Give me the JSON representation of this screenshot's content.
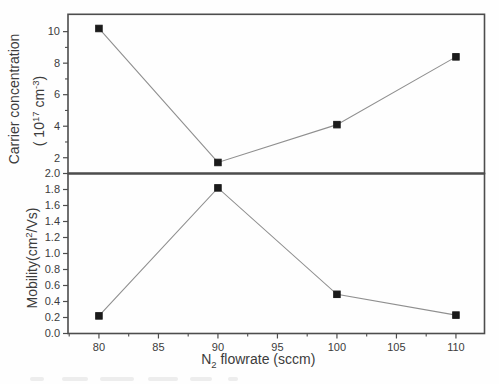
{
  "figure": {
    "colors": {
      "background": "#fefefe",
      "frame": "#4d4d4d",
      "series_line": "#8f8f8f",
      "marker": "#1b1b1b",
      "text": "#3c3c3c"
    }
  },
  "chart_data": [
    {
      "type": "line",
      "panel": "top",
      "series_name": "Carrier concentration",
      "ylabel_line1": "Carrier concentration",
      "ylabel_line2_parts": [
        {
          "t": "( 10"
        },
        {
          "t": "17",
          "script": "sup"
        },
        {
          "t": " cm"
        },
        {
          "t": "-3",
          "script": "sup"
        },
        {
          "t": ")"
        }
      ],
      "x": [
        80,
        90,
        100,
        110
      ],
      "values": [
        10.2,
        1.7,
        4.1,
        8.4
      ],
      "ylim": [
        1.0,
        11.1
      ],
      "yticks": [
        {
          "v": 2,
          "label": "2"
        },
        {
          "v": 4,
          "label": "4"
        },
        {
          "v": 6,
          "label": "6"
        },
        {
          "v": 8,
          "label": "8"
        },
        {
          "v": 10,
          "label": "10"
        }
      ],
      "yticks_minor": [
        3,
        5,
        7,
        9
      ],
      "marker": "filled-square",
      "grid": false,
      "legend": "none"
    },
    {
      "type": "line",
      "panel": "bottom",
      "series_name": "Mobility",
      "ylabel_parts": [
        {
          "t": "Mobility(cm"
        },
        {
          "t": "2",
          "script": "sup"
        },
        {
          "t": "/Vs)"
        }
      ],
      "x": [
        80,
        90,
        100,
        110
      ],
      "values": [
        0.22,
        1.82,
        0.49,
        0.23
      ],
      "ylim": [
        0.0,
        2.0
      ],
      "yticks": [
        {
          "v": 0.0,
          "label": "0.0"
        },
        {
          "v": 0.2,
          "label": "0.2"
        },
        {
          "v": 0.4,
          "label": "0.4"
        },
        {
          "v": 0.6,
          "label": "0.6"
        },
        {
          "v": 0.8,
          "label": "0.8"
        },
        {
          "v": 1.0,
          "label": "1.0"
        },
        {
          "v": 1.2,
          "label": "1.2"
        },
        {
          "v": 1.4,
          "label": "1.4"
        },
        {
          "v": 1.6,
          "label": "1.6"
        },
        {
          "v": 1.8,
          "label": "1.8"
        },
        {
          "v": 2.0,
          "label": "2.0"
        }
      ],
      "yticks_minor": [],
      "marker": "filled-square",
      "grid": false,
      "legend": "none"
    }
  ],
  "x_axis": {
    "label_parts": [
      {
        "t": "N"
      },
      {
        "t": "2",
        "script": "sub"
      },
      {
        "t": " flowrate (sccm)"
      }
    ],
    "xlim": [
      77.4,
      112.4
    ],
    "ticks": [
      {
        "v": 80,
        "label": "80"
      },
      {
        "v": 85,
        "label": "85"
      },
      {
        "v": 90,
        "label": "90"
      },
      {
        "v": 95,
        "label": "95"
      },
      {
        "v": 100,
        "label": "100"
      },
      {
        "v": 105,
        "label": "105"
      },
      {
        "v": 110,
        "label": "110"
      }
    ],
    "ticks_minor": [
      77.5,
      82.5,
      87.5,
      92.5,
      97.5,
      102.5,
      107.5
    ]
  }
}
